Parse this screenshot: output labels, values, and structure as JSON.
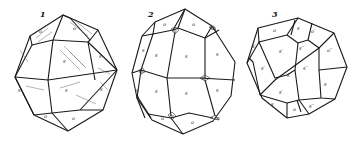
{
  "figures": [
    {
      "number": "1",
      "labels": {
        "top_left": "o",
        "top_right": "o",
        "center": "s",
        "right": "s",
        "left": "s",
        "lower_center": "s",
        "lower_right": "s",
        "bottom_left": "o",
        "bottom_right": "o"
      },
      "shaded": true
    },
    {
      "number": "2",
      "labels": {
        "top_left": "o",
        "top_right": "o",
        "upper_node": "m",
        "right_node": "m",
        "left_node": "m",
        "bottom_node": "m",
        "bottom_right_node": "m",
        "top_right_node": "m",
        "upper_left": "s",
        "upper_center": "s",
        "upper_right": "s",
        "lower_left": "s",
        "lower_center": "s",
        "lower_right": "s",
        "left_edge": "s",
        "left_edge_low": "s",
        "bottom_left": "o",
        "bottom_right": "o"
      },
      "shaded": false
    },
    {
      "number": "3",
      "labels": {
        "top_left": "o",
        "top_mid": "s",
        "top_right": "o′",
        "upper_left": "s′",
        "upper_mid": "s′′",
        "right_upper": "o′′",
        "center_left": "s′",
        "center": "s′",
        "center_right": "s′′",
        "right": "s",
        "lower_left": "s′",
        "bottom_left": "s",
        "bottom_mid": "o",
        "bottom_right": "s′′",
        "left_edge": "s′"
      },
      "shaded": false
    }
  ]
}
